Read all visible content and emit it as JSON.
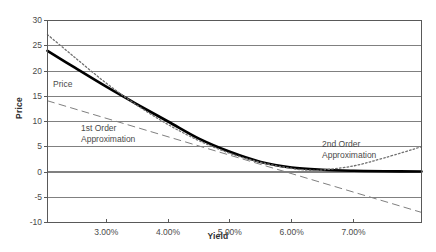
{
  "chart_data": {
    "type": "line",
    "title": "",
    "xlabel": "Yield",
    "ylabel": "Price",
    "grid": true,
    "legend_position": "inline-annotations",
    "xlim": [
      0.0205,
      0.081
    ],
    "ylim": [
      -10,
      30
    ],
    "xticks": [
      0.03,
      0.04,
      0.05,
      0.06,
      0.07
    ],
    "xtick_labels": [
      "3.00%",
      "4.00%",
      "5.00%",
      "6.00%",
      "7.00%"
    ],
    "yticks": [
      -10,
      -5,
      0,
      5,
      10,
      15,
      20,
      25,
      30
    ],
    "ytick_labels": [
      "-10",
      "-5",
      "0",
      "5",
      "10",
      "15",
      "20",
      "25",
      "30"
    ],
    "series": [
      {
        "name": "Price",
        "style": "solid-thick",
        "color": "#000000",
        "x": [
          0.0205,
          0.025,
          0.03,
          0.035,
          0.04,
          0.045,
          0.05,
          0.055,
          0.06,
          0.065,
          0.07,
          0.075,
          0.081
        ],
        "values": [
          24.0,
          20.6,
          16.9,
          13.4,
          10.0,
          6.6,
          4.0,
          2.0,
          0.9,
          0.45,
          0.25,
          0.15,
          0.1
        ]
      },
      {
        "name": "1st Order Approximation",
        "style": "long-dash",
        "color": "#808080",
        "x": [
          0.0205,
          0.081
        ],
        "values": [
          14.1,
          -8.0
        ]
      },
      {
        "name": "2nd Order Approximation",
        "style": "dotted",
        "color": "#707070",
        "x": [
          0.0205,
          0.025,
          0.03,
          0.035,
          0.04,
          0.045,
          0.05,
          0.055,
          0.06,
          0.063,
          0.065,
          0.07,
          0.075,
          0.081
        ],
        "values": [
          27.2,
          22.6,
          17.6,
          13.2,
          9.4,
          6.2,
          3.7,
          1.9,
          0.7,
          0.35,
          0.4,
          1.2,
          2.8,
          5.0
        ]
      }
    ],
    "annotations": [
      {
        "key": "price",
        "text": "Price"
      },
      {
        "key": "first_order",
        "text": "1st Order\nApproximation"
      },
      {
        "key": "second_order",
        "text": "2nd Order\nApproximation"
      }
    ],
    "colors": {
      "background": "#ffffff",
      "gridline": "#808080",
      "axis": "#595959",
      "zero_line": "#808080",
      "text": "#4a4a4a"
    }
  }
}
